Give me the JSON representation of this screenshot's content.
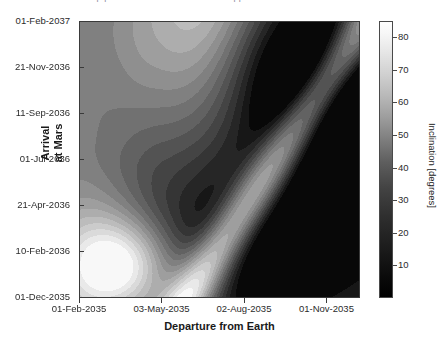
{
  "figure": {
    "cropped_title": "Porkchop plot — Earth to Mars transfer opportunities",
    "background_color": "#ffffff"
  },
  "axes": {
    "xlabel": "Departure from Earth",
    "ylabel": "Arrival\nat Mars",
    "x_ticks": [
      "01-Feb-2035",
      "03-May-2035",
      "02-Aug-2035",
      "01-Nov-2035"
    ],
    "y_ticks": [
      "01-Feb-2037",
      "21-Nov-2036",
      "11-Sep-2036",
      "01-Jul-2036",
      "21-Apr-2036",
      "10-Feb-2036",
      "01-Dec-2035"
    ]
  },
  "colorbar": {
    "label": "Inclination [degrees]",
    "ticks": [
      "80",
      "70",
      "60",
      "50",
      "40",
      "30",
      "20",
      "10"
    ],
    "low_color": "#000000",
    "high_color": "#ffffff"
  },
  "chart_data": {
    "type": "heatmap",
    "title": "Porkchop plot — Earth to Mars transfer opportunities",
    "xlabel": "Departure from Earth",
    "ylabel": "Arrival at Mars",
    "colorbar_label": "Inclination [degrees]",
    "colormap": "gray",
    "zlim": [
      0,
      85
    ],
    "grid": false,
    "legend": "none",
    "x_tick_labels": [
      "01-Feb-2035",
      "03-May-2035",
      "02-Aug-2035",
      "01-Nov-2035"
    ],
    "x_tick_positions": [
      0,
      91,
      182,
      273
    ],
    "x_range_days": [
      0,
      310
    ],
    "y_tick_labels": [
      "01-Dec-2035",
      "10-Feb-2036",
      "21-Apr-2036",
      "01-Jul-2036",
      "11-Sep-2036",
      "21-Nov-2036",
      "01-Feb-2037"
    ],
    "y_tick_positions": [
      0,
      71,
      142,
      213,
      285,
      356,
      428
    ],
    "y_range_days": [
      0,
      428
    ],
    "colorbar_tick_values": [
      10,
      20,
      30,
      40,
      50,
      60,
      70,
      80
    ],
    "contour_levels": [
      5,
      10,
      15,
      20,
      25,
      30,
      35,
      40,
      45,
      50,
      55,
      60,
      65,
      70,
      75,
      80
    ],
    "features": [
      {
        "name": "high-inclination-lobe-lower-left",
        "x_frac": 0.14,
        "y_frac": 0.12,
        "value": 80
      },
      {
        "name": "high-inclination-wedge-top",
        "x_frac": 0.48,
        "y_frac": 0.99,
        "value": 80
      },
      {
        "name": "type-i-type-ii-ridge",
        "from_x_frac": 0.43,
        "from_y_frac": 0.04,
        "to_x_frac": 0.9,
        "to_y_frac": 0.77,
        "value": 80
      },
      {
        "name": "low-inclination-basin-right",
        "x_frac": 0.88,
        "y_frac": 0.2,
        "value": 30
      },
      {
        "name": "low-inclination-band-upper-right",
        "x_frac": 0.8,
        "y_frac": 0.62,
        "value": 8
      },
      {
        "name": "low-inclination-band-bottom-center",
        "x_frac": 0.55,
        "y_frac": 0.02,
        "value": 12
      }
    ],
    "samples": [
      {
        "x_frac": 0.02,
        "y_frac": 0.98,
        "value": 62
      },
      {
        "x_frac": 0.02,
        "y_frac": 0.75,
        "value": 36
      },
      {
        "x_frac": 0.02,
        "y_frac": 0.5,
        "value": 38
      },
      {
        "x_frac": 0.02,
        "y_frac": 0.25,
        "value": 58
      },
      {
        "x_frac": 0.02,
        "y_frac": 0.05,
        "value": 73
      },
      {
        "x_frac": 0.15,
        "y_frac": 0.12,
        "value": 80
      },
      {
        "x_frac": 0.3,
        "y_frac": 0.3,
        "value": 58
      },
      {
        "x_frac": 0.45,
        "y_frac": 0.95,
        "value": 79
      },
      {
        "x_frac": 0.5,
        "y_frac": 0.55,
        "value": 54
      },
      {
        "x_frac": 0.62,
        "y_frac": 0.4,
        "value": 66
      },
      {
        "x_frac": 0.7,
        "y_frac": 0.35,
        "value": 20
      },
      {
        "x_frac": 0.8,
        "y_frac": 0.7,
        "value": 10
      },
      {
        "x_frac": 0.88,
        "y_frac": 0.2,
        "value": 32
      },
      {
        "x_frac": 0.97,
        "y_frac": 0.5,
        "value": 16
      }
    ]
  }
}
